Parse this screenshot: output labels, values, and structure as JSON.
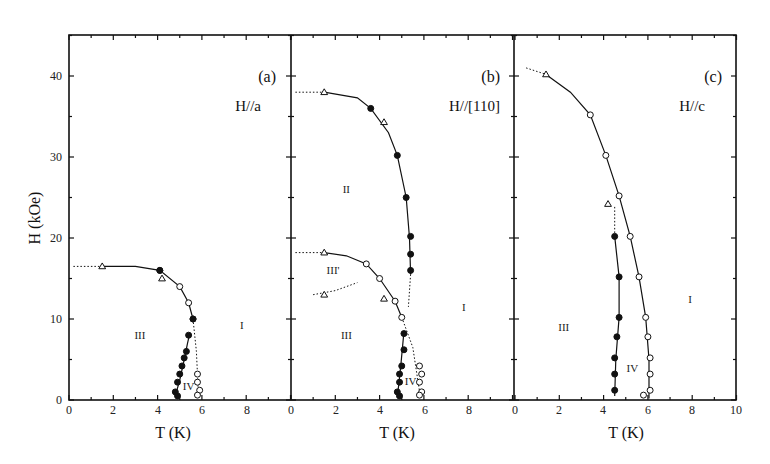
{
  "chart_data": {
    "type": "scatter",
    "title": "",
    "xlabel": "T (K)",
    "ylabel": "H (kOe)",
    "ylim": [
      0,
      45
    ],
    "yticks": [
      0,
      10,
      20,
      30,
      40
    ],
    "grid": false,
    "legend": null,
    "panels": [
      {
        "id": "a",
        "tag": "(a)",
        "field_direction": "H//a",
        "xlim": [
          0,
          10
        ],
        "xticks": [
          0,
          2,
          4,
          6,
          8
        ],
        "phase_labels": [
          {
            "text": "III",
            "T": 3.2,
            "H": 7.5
          },
          {
            "text": "I",
            "T": 7.8,
            "H": 8.8
          },
          {
            "text": "IV",
            "T": 5.4,
            "H": 1.2
          }
        ],
        "series": [
          {
            "name": "open triangles",
            "marker": "triangle-open",
            "points": [
              [
                1.5,
                16.5
              ],
              [
                4.2,
                15.0
              ]
            ]
          },
          {
            "name": "open circles (upper boundary)",
            "marker": "circle-open",
            "points": [
              [
                4.1,
                16.0
              ],
              [
                5.0,
                14.0
              ],
              [
                5.4,
                12.0
              ],
              [
                5.6,
                10.0
              ]
            ]
          },
          {
            "name": "filled circles (III-IV boundary)",
            "marker": "circle-filled",
            "points": [
              [
                4.8,
                1.0
              ],
              [
                4.9,
                0.5
              ],
              [
                4.9,
                2.2
              ],
              [
                5.0,
                3.2
              ],
              [
                5.1,
                4.2
              ],
              [
                5.2,
                5.2
              ],
              [
                5.3,
                6.0
              ],
              [
                5.4,
                8.0
              ],
              [
                4.1,
                16.0
              ],
              [
                5.6,
                10.0
              ]
            ]
          },
          {
            "name": "open circles (IV-I boundary)",
            "marker": "circle-open",
            "points": [
              [
                5.8,
                3.2
              ],
              [
                5.8,
                2.2
              ],
              [
                5.9,
                1.2
              ],
              [
                5.8,
                0.6
              ]
            ]
          }
        ],
        "lines": [
          {
            "style": "solid",
            "points": [
              [
                1.5,
                16.5
              ],
              [
                3.0,
                16.5
              ],
              [
                4.1,
                16.0
              ],
              [
                5.0,
                14.0
              ],
              [
                5.4,
                12.0
              ],
              [
                5.6,
                10.0
              ]
            ]
          },
          {
            "style": "solid",
            "points": [
              [
                4.8,
                0.5
              ],
              [
                5.0,
                2.5
              ],
              [
                5.2,
                5.0
              ],
              [
                5.35,
                7.0
              ],
              [
                5.45,
                8.2
              ]
            ]
          },
          {
            "style": "dotted",
            "points": [
              [
                0.2,
                16.5
              ],
              [
                1.5,
                16.5
              ]
            ]
          },
          {
            "style": "dotted",
            "points": [
              [
                5.6,
                10.0
              ],
              [
                5.75,
                6.0
              ],
              [
                5.85,
                0.2
              ]
            ]
          }
        ]
      },
      {
        "id": "b",
        "tag": "(b)",
        "field_direction": "H//[110]",
        "xlim": [
          0,
          10
        ],
        "xticks": [
          0,
          2,
          4,
          6,
          8
        ],
        "phase_labels": [
          {
            "text": "II",
            "T": 2.5,
            "H": 25.5
          },
          {
            "text": "III'",
            "T": 1.9,
            "H": 15.5
          },
          {
            "text": "III",
            "T": 2.5,
            "H": 7.5
          },
          {
            "text": "I",
            "T": 7.8,
            "H": 11.0
          },
          {
            "text": "IV",
            "T": 5.4,
            "H": 1.8
          }
        ],
        "series": [
          {
            "name": "open triangles",
            "marker": "triangle-open",
            "points": [
              [
                1.5,
                38.0
              ],
              [
                4.2,
                34.3
              ],
              [
                1.5,
                18.2
              ],
              [
                1.5,
                13.0
              ],
              [
                4.2,
                12.5
              ]
            ]
          },
          {
            "name": "filled circles (II-I boundary)",
            "marker": "circle-filled",
            "points": [
              [
                3.6,
                36.0
              ],
              [
                4.8,
                30.2
              ],
              [
                5.2,
                25.0
              ],
              [
                5.4,
                20.2
              ],
              [
                5.4,
                18.0
              ],
              [
                5.4,
                16.0
              ]
            ]
          },
          {
            "name": "open circles (III'-III boundary)",
            "marker": "circle-open",
            "points": [
              [
                3.4,
                16.8
              ],
              [
                4.0,
                15.0
              ],
              [
                4.7,
                12.2
              ],
              [
                5.0,
                10.2
              ]
            ]
          },
          {
            "name": "filled circles (III-IV boundary)",
            "marker": "circle-filled",
            "points": [
              [
                5.1,
                8.2
              ],
              [
                5.1,
                6.2
              ],
              [
                5.0,
                4.2
              ],
              [
                4.9,
                3.2
              ],
              [
                4.9,
                2.2
              ],
              [
                4.8,
                1.0
              ],
              [
                4.9,
                0.5
              ]
            ]
          },
          {
            "name": "open circles (IV-I boundary)",
            "marker": "circle-open",
            "points": [
              [
                5.8,
                4.2
              ],
              [
                5.9,
                3.2
              ],
              [
                5.8,
                2.2
              ],
              [
                5.9,
                1.0
              ],
              [
                5.8,
                0.6
              ]
            ]
          }
        ],
        "lines": [
          {
            "style": "solid",
            "points": [
              [
                1.5,
                38.0
              ],
              [
                3.0,
                37.3
              ],
              [
                3.6,
                36.0
              ],
              [
                4.4,
                33.0
              ],
              [
                4.8,
                30.2
              ],
              [
                5.2,
                25.0
              ],
              [
                5.35,
                20.0
              ],
              [
                5.4,
                15.5
              ]
            ]
          },
          {
            "style": "solid",
            "points": [
              [
                1.5,
                18.2
              ],
              [
                2.5,
                17.8
              ],
              [
                3.4,
                16.8
              ],
              [
                4.0,
                15.0
              ],
              [
                4.7,
                12.2
              ],
              [
                5.0,
                10.2
              ]
            ]
          },
          {
            "style": "solid",
            "points": [
              [
                4.8,
                0.3
              ],
              [
                4.95,
                4.0
              ],
              [
                5.1,
                8.5
              ]
            ]
          },
          {
            "style": "dotted",
            "points": [
              [
                0.2,
                38.0
              ],
              [
                1.5,
                38.0
              ]
            ]
          },
          {
            "style": "dotted",
            "points": [
              [
                0.2,
                18.2
              ],
              [
                1.5,
                18.2
              ]
            ]
          },
          {
            "style": "dotted",
            "points": [
              [
                1.0,
                13.0
              ],
              [
                2.0,
                13.5
              ],
              [
                3.0,
                14.5
              ]
            ]
          },
          {
            "style": "dotted",
            "points": [
              [
                5.4,
                15.5
              ],
              [
                5.3,
                11.5
              ]
            ]
          },
          {
            "style": "dotted",
            "points": [
              [
                5.0,
                10.2
              ],
              [
                5.5,
                6.5
              ],
              [
                5.85,
                0.2
              ]
            ]
          }
        ]
      },
      {
        "id": "c",
        "tag": "(c)",
        "field_direction": "H//c",
        "xlim": [
          0,
          10
        ],
        "xticks": [
          0,
          2,
          4,
          6,
          8,
          10
        ],
        "phase_labels": [
          {
            "text": "III",
            "T": 2.2,
            "H": 8.5
          },
          {
            "text": "I",
            "T": 7.9,
            "H": 12.0
          },
          {
            "text": "IV",
            "T": 5.3,
            "H": 3.5
          }
        ],
        "series": [
          {
            "name": "open triangles",
            "marker": "triangle-open",
            "points": [
              [
                1.4,
                40.2
              ],
              [
                4.2,
                24.2
              ]
            ]
          },
          {
            "name": "open circles (upper boundary)",
            "marker": "circle-open",
            "points": [
              [
                3.4,
                35.2
              ],
              [
                4.1,
                30.2
              ],
              [
                4.7,
                25.2
              ],
              [
                5.2,
                20.2
              ],
              [
                5.6,
                15.2
              ],
              [
                5.9,
                10.2
              ],
              [
                6.0,
                7.8
              ],
              [
                6.1,
                5.2
              ],
              [
                6.1,
                3.2
              ],
              [
                6.1,
                1.2
              ],
              [
                5.8,
                0.6
              ]
            ]
          },
          {
            "name": "filled circles (III-IV boundary)",
            "marker": "circle-filled",
            "points": [
              [
                4.5,
                20.2
              ],
              [
                4.7,
                15.2
              ],
              [
                4.7,
                10.2
              ],
              [
                4.6,
                7.8
              ],
              [
                4.5,
                5.2
              ],
              [
                4.5,
                3.2
              ],
              [
                4.5,
                1.2
              ]
            ]
          }
        ],
        "lines": [
          {
            "style": "solid",
            "points": [
              [
                1.4,
                40.2
              ],
              [
                2.5,
                38.0
              ],
              [
                3.4,
                35.2
              ],
              [
                4.1,
                30.2
              ],
              [
                4.7,
                25.2
              ],
              [
                5.2,
                20.2
              ],
              [
                5.6,
                15.2
              ],
              [
                5.9,
                10.2
              ],
              [
                6.05,
                5.0
              ],
              [
                6.05,
                0.2
              ]
            ]
          },
          {
            "style": "solid",
            "points": [
              [
                4.5,
                20.2
              ],
              [
                4.7,
                15.2
              ],
              [
                4.7,
                10.2
              ],
              [
                4.55,
                5.0
              ],
              [
                4.5,
                0.5
              ]
            ]
          },
          {
            "style": "dotted",
            "points": [
              [
                0.5,
                41.0
              ],
              [
                1.4,
                40.2
              ]
            ]
          },
          {
            "style": "dotted",
            "points": [
              [
                4.5,
                20.2
              ],
              [
                4.5,
                24.0
              ]
            ]
          }
        ]
      }
    ]
  },
  "figure": {
    "ylabel": "H (kOe)",
    "xlabel": "T (K)",
    "panels": {
      "a": {
        "tag": "(a)",
        "direction": "H//a"
      },
      "b": {
        "tag": "(b)",
        "direction": "H//[110]"
      },
      "c": {
        "tag": "(c)",
        "direction": "H//c"
      }
    },
    "ytick_labels": [
      "0",
      "10",
      "20",
      "30",
      "40"
    ],
    "xtick_labels_a": [
      "0",
      "2",
      "4",
      "6",
      "8"
    ],
    "xtick_labels_b": [
      "0",
      "2",
      "4",
      "6",
      "8"
    ],
    "xtick_labels_c": [
      "0",
      "2",
      "4",
      "6",
      "8",
      "10"
    ],
    "colors": {
      "ink": "#111111",
      "background": "#ffffff"
    }
  }
}
